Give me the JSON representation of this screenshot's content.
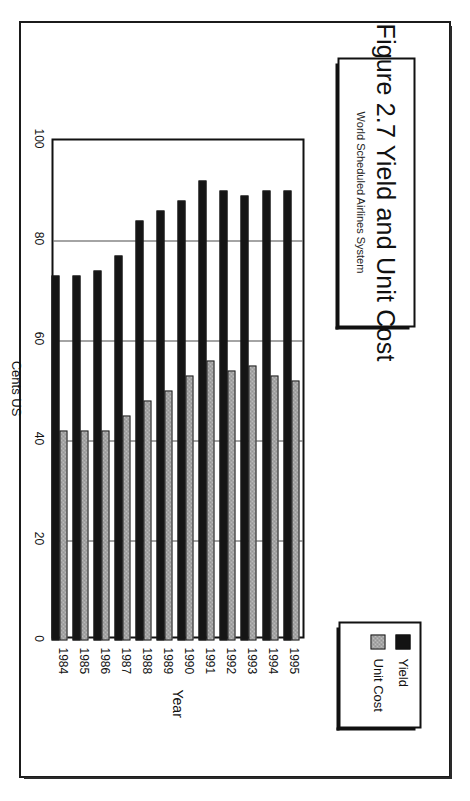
{
  "figure": {
    "title": "Figure 2.7  Yield and Unit Cost",
    "subtitle": "World Scheduled Airlines System",
    "source": "Source: IATA, World Air Transport Statistics"
  },
  "legend": {
    "items": [
      {
        "label": "Yield",
        "swatch": "black-square-icon",
        "color": "#131313"
      },
      {
        "label": "Unit Cost",
        "swatch": "gray-hatched-square-icon",
        "color": "#bdbdbd"
      }
    ]
  },
  "axes": {
    "value_title": "Cents US",
    "value_ticks": [
      "100",
      "80",
      "60",
      "40",
      "20",
      "0"
    ],
    "category_title": "Year"
  },
  "chart_data": {
    "type": "bar",
    "orientation": "horizontal",
    "title": "Figure 2.7  Yield and Unit Cost",
    "subtitle": "World Scheduled Airlines System",
    "xlabel": "Cents US",
    "ylabel": "Year",
    "xlim": [
      0,
      100
    ],
    "grid": true,
    "legend_position": "top-right",
    "categories": [
      "1984",
      "1985",
      "1986",
      "1987",
      "1988",
      "1989",
      "1990",
      "1991",
      "1992",
      "1993",
      "1994",
      "1995"
    ],
    "series": [
      {
        "name": "Yield",
        "color": "#131313",
        "values": [
          73,
          73,
          74,
          77,
          84,
          86,
          88,
          92,
          90,
          89,
          90,
          90
        ]
      },
      {
        "name": "Unit Cost",
        "color": "#bdbdbd",
        "values": [
          42,
          42,
          42,
          45,
          48,
          50,
          53,
          56,
          54,
          55,
          53,
          52
        ]
      }
    ]
  }
}
